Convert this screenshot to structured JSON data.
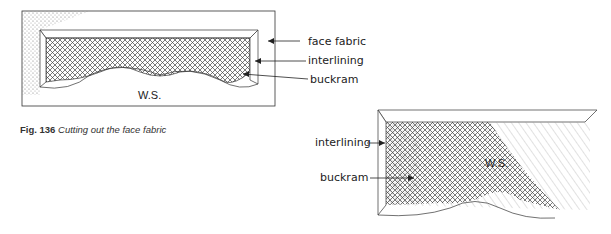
{
  "figure1": {
    "label_face_fabric": "face fabric",
    "label_interlining": "interlining",
    "label_buckram": "buckram",
    "side_label": "W.S."
  },
  "figure2": {
    "label_interlining": "interlining",
    "label_buckram": "buckram",
    "side_label": "W.S."
  },
  "caption": {
    "number": "Fig. 136",
    "text": "Cutting out the face fabric"
  }
}
